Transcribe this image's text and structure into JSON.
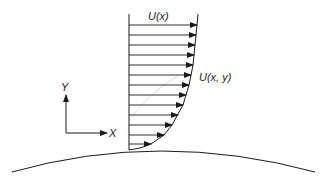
{
  "diagram": {
    "type": "boundary-layer-velocity-profile",
    "labels": {
      "freestream": "U(x)",
      "profile": "U(x, y)",
      "axis_y": "Y",
      "axis_x": "X"
    },
    "colors": {
      "stroke": "#1a1a1a",
      "faint_arc": "#cfcfcf",
      "background": "#ffffff"
    },
    "profile": {
      "wall_x": 129,
      "top_y": 14,
      "wall_y": 150,
      "arrows": [
        {
          "y": 25,
          "tip_x": 197
        },
        {
          "y": 35,
          "tip_x": 196
        },
        {
          "y": 45,
          "tip_x": 195
        },
        {
          "y": 55,
          "tip_x": 194
        },
        {
          "y": 65,
          "tip_x": 193
        },
        {
          "y": 75,
          "tip_x": 191
        },
        {
          "y": 85,
          "tip_x": 189
        },
        {
          "y": 95,
          "tip_x": 186
        },
        {
          "y": 105,
          "tip_x": 183
        },
        {
          "y": 115,
          "tip_x": 178
        },
        {
          "y": 125,
          "tip_x": 172
        },
        {
          "y": 135,
          "tip_x": 164
        },
        {
          "y": 144,
          "tip_x": 151
        }
      ]
    }
  }
}
